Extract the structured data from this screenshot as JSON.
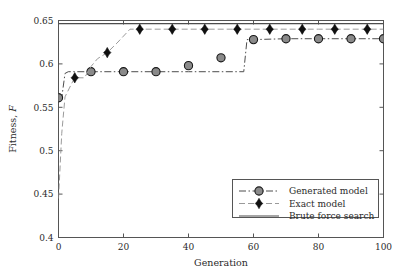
{
  "chart_data": {
    "type": "line",
    "title": "",
    "xlabel": "Generation",
    "ylabel": "Fitness, F",
    "xlim": [
      0,
      100
    ],
    "ylim": [
      0.4,
      0.65
    ],
    "xticks": [
      0,
      20,
      40,
      60,
      80,
      100
    ],
    "yticks": [
      0.4,
      0.45,
      0.5,
      0.55,
      0.6,
      0.65
    ],
    "xtick_labels": [
      "0",
      "20",
      "40",
      "60",
      "80",
      "100"
    ],
    "ytick_labels": [
      "0.4",
      "0.45",
      "0.5",
      "0.55",
      "0.6",
      "0.65"
    ],
    "grid": false,
    "legend_position": "lower right",
    "series": [
      {
        "name": "Generated model",
        "style": "dash-dot",
        "marker": "circle",
        "color": "#808080",
        "line_color": "#4d4d4d",
        "x": [
          0,
          1,
          2,
          3,
          4,
          5,
          10,
          20,
          30,
          40,
          50,
          57,
          58,
          60,
          70,
          80,
          90,
          100
        ],
        "y": [
          0.561,
          0.561,
          0.589,
          0.591,
          0.591,
          0.591,
          0.591,
          0.591,
          0.591,
          0.591,
          0.591,
          0.591,
          0.628,
          0.628,
          0.629,
          0.629,
          0.629,
          0.629
        ],
        "marker_x": [
          0,
          10,
          20,
          30,
          40,
          50,
          60,
          70,
          80,
          90,
          100
        ],
        "marker_y": [
          0.561,
          0.591,
          0.591,
          0.591,
          0.598,
          0.607,
          0.628,
          0.629,
          0.629,
          0.629,
          0.629
        ]
      },
      {
        "name": "Exact model",
        "style": "dashed",
        "marker": "diamond",
        "color": "#101010",
        "line_color": "#9a9a9a",
        "x": [
          0,
          1,
          2,
          4,
          5,
          8,
          10,
          12,
          15,
          18,
          20,
          22,
          25,
          30,
          40,
          50,
          60,
          70,
          80,
          90,
          100
        ],
        "y": [
          0.445,
          0.52,
          0.562,
          0.577,
          0.584,
          0.584,
          0.597,
          0.606,
          0.613,
          0.624,
          0.632,
          0.64,
          0.64,
          0.64,
          0.64,
          0.64,
          0.64,
          0.64,
          0.64,
          0.64,
          0.64
        ],
        "marker_x": [
          5,
          15,
          25,
          35,
          45,
          55,
          65,
          75,
          85,
          95
        ],
        "marker_y": [
          0.584,
          0.613,
          0.64,
          0.64,
          0.64,
          0.64,
          0.64,
          0.64,
          0.64,
          0.64
        ]
      },
      {
        "name": "Brute force search",
        "style": "solid",
        "marker": "none",
        "color": "#4d4d4d",
        "line_color": "#4d4d4d",
        "x": [
          0,
          100
        ],
        "y": [
          0.6465,
          0.6465
        ],
        "marker_x": [],
        "marker_y": []
      }
    ],
    "legend": [
      {
        "label": "Generated model",
        "style": "dash-dot",
        "marker": "circle"
      },
      {
        "label": "Exact model",
        "style": "dashed",
        "marker": "diamond"
      },
      {
        "label": "Brute force search",
        "style": "solid",
        "marker": "none"
      }
    ]
  },
  "axes": {
    "frame_color": "#555555"
  }
}
